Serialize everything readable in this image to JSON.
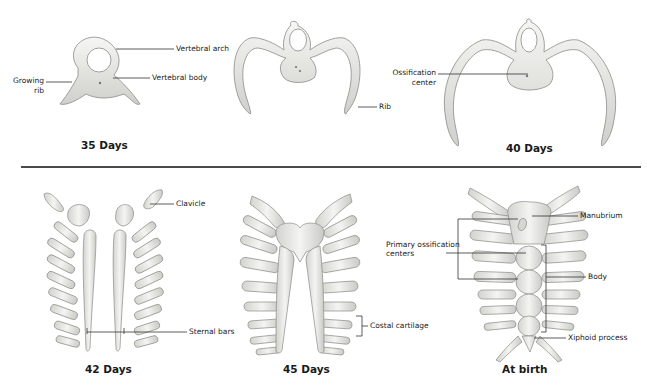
{
  "figure": {
    "top_row": [
      {
        "caption": "35 Days",
        "labels": {
          "vertebral_arch": "Vertebral arch",
          "vertebral_body": "Vertebral body",
          "growing_rib_line1": "Growing",
          "growing_rib_line2": "rib"
        }
      },
      {
        "caption": "",
        "labels": {
          "rib": "Rib"
        }
      },
      {
        "caption": "40 Days",
        "labels": {
          "ossification_line1": "Ossification",
          "ossification_line2": "center"
        }
      }
    ],
    "bottom_row": [
      {
        "caption": "42 Days",
        "labels": {
          "clavicle": "Clavicle",
          "sternal_bars": "Sternal bars"
        }
      },
      {
        "caption": "45 Days",
        "labels": {
          "costal_cartilage": "Costal cartilage"
        }
      },
      {
        "caption": "At birth",
        "labels": {
          "manubrium": "Manubrium",
          "primary_line1": "Primary ossification",
          "primary_line2": "centers",
          "body": "Body",
          "xiphoid": "Xiphoid process"
        }
      }
    ],
    "colors": {
      "bone_fill": "#e9e9e6",
      "bone_stroke": "#8a8a86",
      "leader_line": "#333333",
      "separator": "#4a4a4a"
    }
  }
}
